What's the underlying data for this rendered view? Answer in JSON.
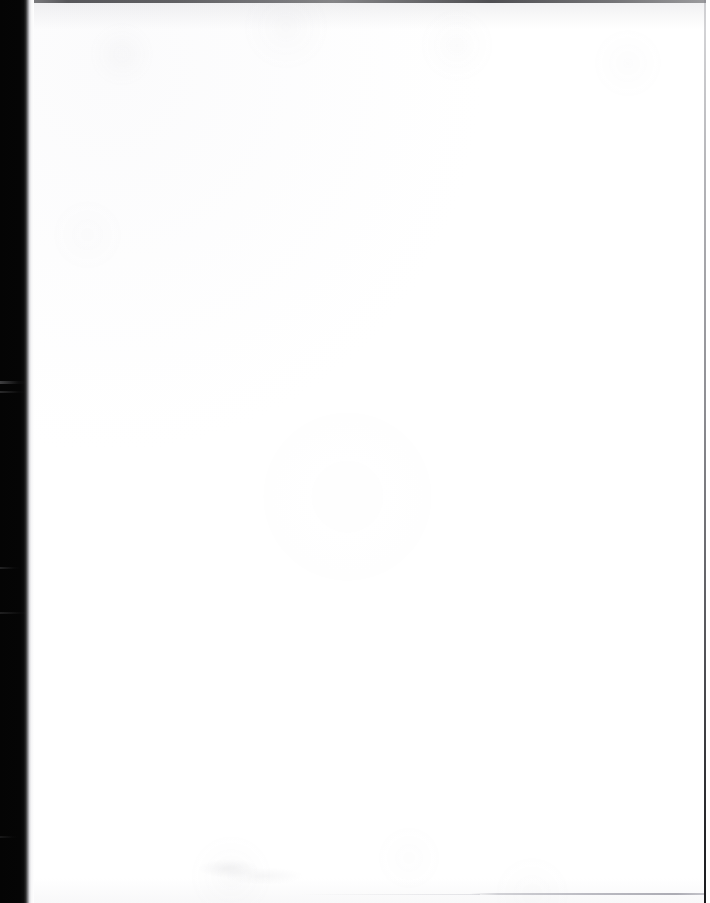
{
  "document": {
    "kind": "scanned-page",
    "page_content_text": "",
    "page_state_label": "Blank page",
    "orientation": "portrait",
    "width_px": 710,
    "height_px": 903
  },
  "artifacts": {
    "left_gutter": {
      "name": "scanner-gutter-shadow",
      "description": "Black binding-gutter shadow along the left edge",
      "color": "#040404",
      "x_start_px": 0,
      "x_end_px": 34
    },
    "top_edge": {
      "name": "page-top-edge-line",
      "description": "Thin dark line marking the top edge of the sheet",
      "color": "#2e2e32",
      "y_px": 0,
      "thickness_px": 3
    },
    "right_edge": {
      "name": "page-right-edge-line",
      "description": "Thin dark line marking the right edge of the sheet",
      "color": "#3c3c42",
      "x_px": 704,
      "thickness_px": 2
    },
    "bottom_rule": {
      "name": "bottom-faint-rule",
      "description": "Faint gray horizontal line across the lower right of the page",
      "color": "#a0a0aa",
      "y_px": 893,
      "x_start_px": 470,
      "x_end_px": 704
    },
    "smudge": {
      "name": "paper-smudge",
      "description": "Very faint gray smudge near the bottom centre-left",
      "color": "#96969e",
      "x_px": 196,
      "y_px": 858
    }
  },
  "colors": {
    "paper": "#ffffff",
    "paper_tint": "#fbfbfc",
    "gutter_black": "#040404",
    "edge_line": "#2e2e32",
    "faint_rule": "#a0a0aa"
  }
}
